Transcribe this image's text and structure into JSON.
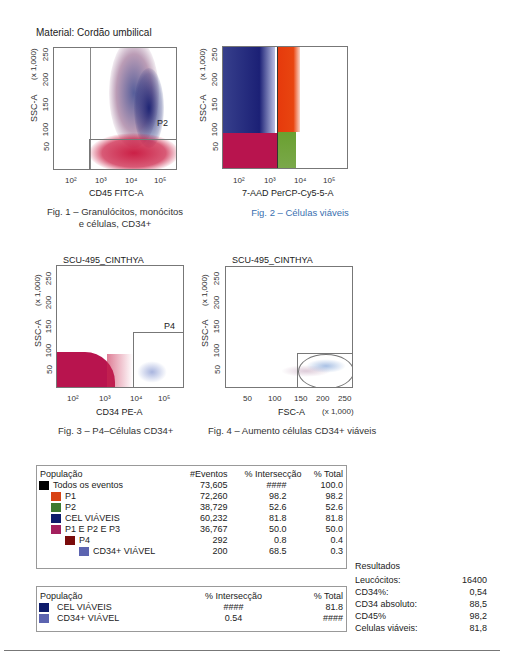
{
  "header": {
    "material": "Material: Cordão umbilical"
  },
  "figures": [
    {
      "id": "fig1",
      "ylabel": "SSC-A",
      "yscale": "(x 1,000)",
      "yticks": [
        "250",
        "200",
        "150",
        "100",
        "50"
      ],
      "xticks": [
        "10²",
        "10³",
        "10⁴",
        "10⁵"
      ],
      "xlabel": "CD45 FITC-A",
      "gate": "P2",
      "caption_line1": "Fig. 1 – Granulócitos, monócitos",
      "caption_line2": "e células, CD34+"
    },
    {
      "id": "fig2",
      "ylabel": "SSC-A",
      "yscale": "(x 1,000)",
      "yticks": [
        "250",
        "200",
        "150",
        "100",
        "50"
      ],
      "xticks": [
        "10²",
        "10³",
        "10⁴",
        "10⁵"
      ],
      "xlabel": "7-AAD PerCP-Cy5-5-A",
      "caption": "Fig. 2 – Células viáveis"
    },
    {
      "id": "fig3",
      "title": "SCU-495_CINTHYA",
      "ylabel": "SSC-A",
      "yscale": "(x 1,000)",
      "yticks": [
        "250",
        "200",
        "150",
        "100",
        "50"
      ],
      "xticks": [
        "10²",
        "10³",
        "10⁴",
        "10⁵"
      ],
      "xlabel": "CD34 PE-A",
      "gate": "P4",
      "caption": "Fig. 3 – P4–Células CD34+"
    },
    {
      "id": "fig4",
      "title": "SCU-495_CINTHYA",
      "ylabel": "SSC-A",
      "yscale": "(x 1,000)",
      "yticks": [
        "250",
        "200",
        "150",
        "100",
        "50"
      ],
      "xticks": [
        "50",
        "100",
        "150",
        "200",
        "250"
      ],
      "xlabel": "FSC-A",
      "xscale": "(x 1,000)",
      "caption": "Fig. 4 – Aumento células CD34+ viáveis"
    }
  ],
  "table1": {
    "headers": [
      "População",
      "#Eventos",
      "% Intersecção",
      "% Total"
    ],
    "rows": [
      {
        "name": "Todos os eventos",
        "color": "#000000",
        "indent": 0,
        "events": "73,605",
        "intersect": "####",
        "total": "100.0"
      },
      {
        "name": "P1",
        "color": "#d84315",
        "indent": 1,
        "events": "72,260",
        "intersect": "98.2",
        "total": "98.2"
      },
      {
        "name": "P2",
        "color": "#3e7a30",
        "indent": 1,
        "events": "38,729",
        "intersect": "52.6",
        "total": "52.6"
      },
      {
        "name": "CEL VIÁVEIS",
        "color": "#0d1b6b",
        "indent": 1,
        "events": "60,232",
        "intersect": "81.8",
        "total": "81.8"
      },
      {
        "name": "P1 E P2 E P3",
        "color": "#a3205e",
        "indent": 1,
        "events": "36,767",
        "intersect": "50.0",
        "total": "50.0"
      },
      {
        "name": "P4",
        "color": "#7a0b0b",
        "indent": 2,
        "events": "292",
        "intersect": "0.8",
        "total": "0.4"
      },
      {
        "name": "CD34+ VIÁVEL",
        "color": "#5c64b0",
        "indent": 3,
        "events": "200",
        "intersect": "68.5",
        "total": "0.3"
      }
    ]
  },
  "table2": {
    "headers": [
      "População",
      "% Intersecção",
      "% Total"
    ],
    "rows": [
      {
        "name": "CEL VIÁVEIS",
        "color": "#0d1b6b",
        "intersect": "####",
        "total": "81.8"
      },
      {
        "name": "CD34+ VIÁVEL",
        "color": "#5c64b0",
        "intersect": "0.54",
        "total": "####"
      }
    ]
  },
  "results": {
    "title": "Resultados",
    "items": [
      {
        "label": "Leucócitos:",
        "value": "16400"
      },
      {
        "label": "CD34%:",
        "value": "0,54"
      },
      {
        "label": "CD34 absoluto:",
        "value": "88,5"
      },
      {
        "label": "CD45%",
        "value": "98,2"
      },
      {
        "label": "Celulas viáveis:",
        "value": "81,8"
      }
    ]
  }
}
